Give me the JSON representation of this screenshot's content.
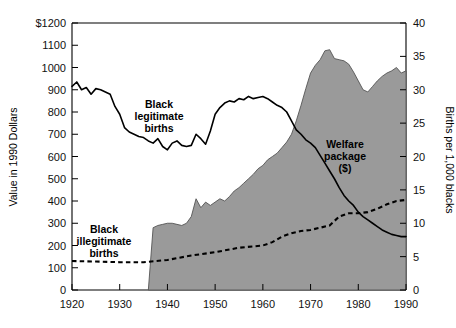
{
  "chart_data": {
    "type": "area",
    "title": "",
    "subtitle": "",
    "ylabel": "Value in 1990 Dollars",
    "ylabel_right": "Births per 1,000 blacks",
    "xlabel": "",
    "xlim": [
      1920,
      1990
    ],
    "ylim_left": [
      0,
      1200
    ],
    "ylim_right": [
      0,
      40
    ],
    "grid": false,
    "legend_position": "inline-annotations",
    "x_ticks": [
      1920,
      1930,
      1940,
      1950,
      1960,
      1970,
      1980,
      1990
    ],
    "x_tick_labels": [
      "1920",
      "1930",
      "1940",
      "1950",
      "1960",
      "1970",
      "1980",
      "1990"
    ],
    "y_ticks_left": [
      0,
      100,
      200,
      300,
      400,
      500,
      600,
      700,
      800,
      900,
      1000,
      1100,
      1200
    ],
    "y_tick_labels_left": [
      "0",
      "100",
      "200",
      "300",
      "400",
      "500",
      "600",
      "700",
      "800",
      "900",
      "1000",
      "1100",
      "$1200"
    ],
    "y_ticks_right": [
      0,
      5,
      10,
      15,
      20,
      25,
      30,
      35,
      40
    ],
    "y_tick_labels_right": [
      "0",
      "5",
      "10",
      "15",
      "20",
      "25",
      "30",
      "35",
      "40"
    ],
    "annotations": [
      {
        "name": "black-legitimate-births",
        "lines": [
          "Black",
          "legitimate",
          "births"
        ],
        "x": 1950.5,
        "y_left": 790
      },
      {
        "name": "black-illegitimate-births",
        "lines": [
          "Black",
          "illegitimate",
          "births"
        ],
        "x": 1934.5,
        "y_left": 215
      },
      {
        "name": "welfare-package",
        "lines": [
          "Welfare",
          "package",
          "($)"
        ],
        "x": 1974.0,
        "y_left": 560
      }
    ],
    "colors": {
      "area_fill": "#9a9a9a",
      "area_stroke": "#4d4d4d",
      "line_solid": "#000000",
      "line_dashed": "#000000",
      "axis": "#000000",
      "background": "#ffffff"
    },
    "series": [
      {
        "name": "Welfare package ($)",
        "style": "area",
        "axis": "left",
        "units": "1990 dollars",
        "x": [
          1936,
          1937,
          1938,
          1939,
          1940,
          1941,
          1942,
          1943,
          1944,
          1945,
          1946,
          1947,
          1948,
          1949,
          1950,
          1951,
          1952,
          1953,
          1954,
          1955,
          1956,
          1957,
          1958,
          1959,
          1960,
          1961,
          1962,
          1963,
          1964,
          1965,
          1966,
          1967,
          1968,
          1969,
          1970,
          1971,
          1972,
          1973,
          1974,
          1975,
          1976,
          1977,
          1978,
          1979,
          1980,
          1981,
          1982,
          1983,
          1984,
          1985,
          1986,
          1987,
          1988,
          1989,
          1990
        ],
        "values": [
          0,
          280,
          290,
          295,
          300,
          300,
          295,
          290,
          300,
          330,
          410,
          370,
          395,
          380,
          395,
          410,
          400,
          420,
          445,
          460,
          480,
          500,
          520,
          545,
          560,
          585,
          600,
          615,
          640,
          665,
          700,
          760,
          830,
          905,
          975,
          1010,
          1035,
          1075,
          1080,
          1040,
          1035,
          1030,
          1015,
          980,
          940,
          900,
          890,
          915,
          940,
          960,
          975,
          985,
          1000,
          975,
          985
        ]
      },
      {
        "name": "Black legitimate births",
        "style": "solid-line",
        "axis": "right",
        "units": "births per 1,000 blacks",
        "x": [
          1920,
          1921,
          1922,
          1923,
          1924,
          1925,
          1926,
          1927,
          1928,
          1929,
          1930,
          1931,
          1932,
          1933,
          1934,
          1935,
          1936,
          1937,
          1938,
          1939,
          1940,
          1941,
          1942,
          1943,
          1944,
          1945,
          1946,
          1947,
          1948,
          1949,
          1950,
          1951,
          1952,
          1953,
          1954,
          1955,
          1956,
          1957,
          1958,
          1959,
          1960,
          1961,
          1962,
          1963,
          1964,
          1965,
          1966,
          1967,
          1968,
          1969,
          1970,
          1971,
          1972,
          1973,
          1974,
          1975,
          1976,
          1977,
          1978,
          1979,
          1980,
          1981,
          1982,
          1983,
          1984,
          1985,
          1986,
          1987,
          1988,
          1989,
          1990
        ],
        "values_left_scale": [
          915,
          935,
          900,
          910,
          880,
          905,
          900,
          890,
          880,
          825,
          790,
          730,
          710,
          700,
          690,
          685,
          670,
          660,
          680,
          645,
          630,
          660,
          670,
          650,
          645,
          650,
          700,
          680,
          655,
          715,
          790,
          820,
          840,
          850,
          845,
          860,
          855,
          870,
          860,
          865,
          870,
          860,
          845,
          830,
          820,
          800,
          760,
          720,
          700,
          675,
          660,
          640,
          605,
          570,
          535,
          500,
          460,
          425,
          400,
          380,
          350,
          330,
          315,
          300,
          285,
          270,
          260,
          250,
          245,
          240,
          240
        ],
        "values_right_scale": [
          30.5,
          31.2,
          30.0,
          30.3,
          29.3,
          30.2,
          30.0,
          29.7,
          29.3,
          27.5,
          26.3,
          24.3,
          23.7,
          23.3,
          23.0,
          22.8,
          22.3,
          22.0,
          22.7,
          21.5,
          21.0,
          22.0,
          22.3,
          21.7,
          21.5,
          21.7,
          23.3,
          22.7,
          21.8,
          23.8,
          26.3,
          27.3,
          28.0,
          28.3,
          28.2,
          28.7,
          28.5,
          29.0,
          28.7,
          28.8,
          29.0,
          28.7,
          28.2,
          27.7,
          27.3,
          26.7,
          25.3,
          24.0,
          23.3,
          22.5,
          22.0,
          21.3,
          20.2,
          19.0,
          17.8,
          16.7,
          15.3,
          14.2,
          13.3,
          12.7,
          11.7,
          11.0,
          10.5,
          10.0,
          9.5,
          9.0,
          8.7,
          8.3,
          8.2,
          8.0,
          8.0
        ]
      },
      {
        "name": "Black illegitimate births",
        "style": "dashed-line",
        "axis": "right",
        "units": "births per 1,000 blacks",
        "x": [
          1920,
          1925,
          1930,
          1935,
          1940,
          1945,
          1950,
          1955,
          1960,
          1962,
          1964,
          1966,
          1968,
          1970,
          1972,
          1974,
          1976,
          1978,
          1980,
          1982,
          1984,
          1986,
          1988,
          1990
        ],
        "values_left_scale": [
          130,
          128,
          125,
          125,
          135,
          155,
          170,
          190,
          200,
          215,
          240,
          255,
          265,
          270,
          280,
          290,
          330,
          345,
          345,
          350,
          365,
          385,
          400,
          405
        ],
        "values_right_scale": [
          4.3,
          4.3,
          4.2,
          4.2,
          4.5,
          5.2,
          5.7,
          6.3,
          6.7,
          7.2,
          8.0,
          8.5,
          8.8,
          9.0,
          9.3,
          9.7,
          11.0,
          11.5,
          11.5,
          11.7,
          12.2,
          12.8,
          13.3,
          13.5
        ]
      }
    ]
  },
  "axes": {
    "left_title": "Value in 1990 Dollars",
    "right_title": "Births per 1,000 blacks"
  }
}
